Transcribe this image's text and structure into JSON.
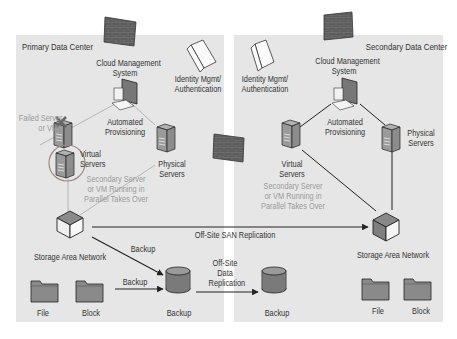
{
  "primary": {
    "title": "Primary Data Center",
    "cloud_mgmt": [
      "Cloud Management",
      "System"
    ],
    "identity": [
      "Identity Mgmt/",
      "Authentication"
    ],
    "automated": [
      "Automated",
      "Provisioning"
    ],
    "failed": [
      "Failed Server",
      "or VM"
    ],
    "virtual": [
      "Virtual",
      "Servers"
    ],
    "physical": [
      "Physical",
      "Servers"
    ],
    "secondary_note": [
      "Secondary Server",
      "or VM Running in",
      "Parallel Takes Over"
    ],
    "san": "Storage Area Network",
    "backup_arrow_1": "Backup",
    "backup_arrow_2": "Backup",
    "backup_db": "Backup",
    "file": "File",
    "block": "Block"
  },
  "secondary": {
    "title": "Secondary Data Center",
    "cloud_mgmt": [
      "Cloud Management",
      "System"
    ],
    "identity": [
      "Identity Mgmt/",
      "Authentication"
    ],
    "automated": [
      "Automated",
      "Provisioning"
    ],
    "virtual": [
      "Virtual",
      "Servers"
    ],
    "physical": [
      "Physical",
      "Servers"
    ],
    "secondary_note": [
      "Secondary Server",
      "or VM Running in",
      "Parallel Takes Over"
    ],
    "san": "Storage Area Network",
    "backup_db": "Backup",
    "file": "File",
    "block": "Block"
  },
  "links": {
    "san_replication": "Off-Site SAN Replication",
    "data_replication": [
      "Off-Site",
      "Data",
      "Replication"
    ]
  },
  "colors": {
    "panel": "#e6e6e6",
    "firewall": "#5a5a5a",
    "server": "#8c8c8c",
    "database": "#7a7a7a",
    "folder": "#8a8a8a",
    "line": "#222222",
    "faint_line": "#b5b5b5",
    "failed_circle": "#a08a80"
  }
}
